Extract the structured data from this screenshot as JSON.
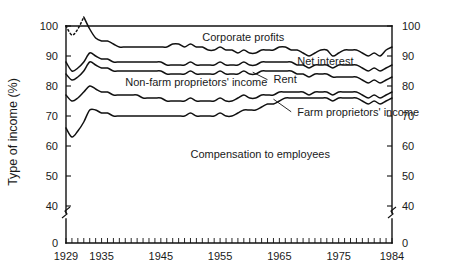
{
  "chart_data": {
    "type": "line",
    "title": "",
    "xlabel": "",
    "ylabel": "Type of income (%)",
    "xlim": [
      1929,
      1984
    ],
    "ylim": [
      35,
      103
    ],
    "grid": false,
    "legend_position": "inline-annotations",
    "axis_break": "y-axis broken between 0 and 40",
    "x_ticks_major": [
      "1929",
      "1935",
      "1945",
      "1955",
      "1965",
      "1975",
      "1984"
    ],
    "y_ticks_left": [
      "100",
      "90",
      "80",
      "70",
      "60",
      "50",
      "40",
      "0"
    ],
    "y_ticks_right": [
      "100",
      "90",
      "80",
      "70",
      "60",
      "50",
      "40",
      "0"
    ],
    "annotations": [
      {
        "text": "Corporate profits",
        "x": 1952,
        "y": 95
      },
      {
        "text": "Net interest",
        "x": 1968,
        "y": 87
      },
      {
        "text": "Rent",
        "x": 1964,
        "y": 81
      },
      {
        "text": "Non-farm proprietors' income",
        "x": 1939,
        "y": 80
      },
      {
        "text": "Farm proprietors' income",
        "x": 1968,
        "y": 70
      },
      {
        "text": "Compensation to employees",
        "x": 1950,
        "y": 56
      }
    ],
    "series": [
      {
        "name": "Corporate profits (upper boundary)",
        "note": "cumulative top boundary; dotted where data interpolated 1930-1932",
        "x": [
          1929,
          1930,
          1931,
          1932,
          1933,
          1934,
          1935,
          1936,
          1937,
          1938,
          1939,
          1940,
          1941,
          1942,
          1943,
          1944,
          1945,
          1946,
          1947,
          1948,
          1949,
          1950,
          1951,
          1952,
          1953,
          1954,
          1955,
          1956,
          1957,
          1958,
          1959,
          1960,
          1961,
          1962,
          1963,
          1964,
          1965,
          1966,
          1967,
          1968,
          1969,
          1970,
          1971,
          1972,
          1973,
          1974,
          1975,
          1976,
          1977,
          1978,
          1979,
          1980,
          1981,
          1982,
          1983,
          1984
        ],
        "y": [
          100,
          97,
          99,
          103,
          99,
          96,
          95,
          95,
          94,
          93,
          93,
          93,
          93,
          93,
          93,
          93,
          93,
          93,
          94,
          94,
          93,
          94,
          93,
          93,
          92,
          92,
          93,
          92,
          92,
          91,
          92,
          91,
          91,
          92,
          92,
          92,
          93,
          93,
          92,
          92,
          91,
          90,
          91,
          92,
          92,
          90,
          91,
          92,
          92,
          92,
          91,
          90,
          91,
          90,
          92,
          93
        ],
        "dotted_segment_x": [
          1929,
          1932
        ]
      },
      {
        "name": "Net interest (boundary below corporate profits)",
        "x": [
          1929,
          1930,
          1931,
          1932,
          1933,
          1934,
          1935,
          1936,
          1937,
          1938,
          1939,
          1940,
          1941,
          1942,
          1943,
          1944,
          1945,
          1946,
          1947,
          1948,
          1949,
          1950,
          1951,
          1952,
          1953,
          1954,
          1955,
          1956,
          1957,
          1958,
          1959,
          1960,
          1961,
          1962,
          1963,
          1964,
          1965,
          1966,
          1967,
          1968,
          1969,
          1970,
          1971,
          1972,
          1973,
          1974,
          1975,
          1976,
          1977,
          1978,
          1979,
          1980,
          1981,
          1982,
          1983,
          1984
        ],
        "y": [
          88,
          85,
          86,
          88,
          91,
          90,
          89,
          89,
          88,
          88,
          88,
          88,
          88,
          88,
          88,
          88,
          88,
          87,
          87,
          87,
          87,
          88,
          87,
          87,
          87,
          87,
          88,
          87,
          87,
          87,
          88,
          87,
          87,
          88,
          88,
          88,
          88,
          88,
          88,
          87,
          87,
          86,
          87,
          87,
          87,
          86,
          87,
          87,
          87,
          87,
          86,
          85,
          86,
          85,
          86,
          87
        ]
      },
      {
        "name": "Rent (boundary below net interest)",
        "x": [
          1929,
          1930,
          1931,
          1932,
          1933,
          1934,
          1935,
          1936,
          1937,
          1938,
          1939,
          1940,
          1941,
          1942,
          1943,
          1944,
          1945,
          1946,
          1947,
          1948,
          1949,
          1950,
          1951,
          1952,
          1953,
          1954,
          1955,
          1956,
          1957,
          1958,
          1959,
          1960,
          1961,
          1962,
          1963,
          1964,
          1965,
          1966,
          1967,
          1968,
          1969,
          1970,
          1971,
          1972,
          1973,
          1974,
          1975,
          1976,
          1977,
          1978,
          1979,
          1980,
          1981,
          1982,
          1983,
          1984
        ],
        "y": [
          84,
          82,
          83,
          85,
          88,
          87,
          86,
          86,
          85,
          85,
          85,
          85,
          85,
          85,
          85,
          85,
          85,
          84,
          84,
          84,
          84,
          85,
          84,
          84,
          84,
          84,
          85,
          84,
          84,
          84,
          85,
          84,
          84,
          85,
          85,
          85,
          85,
          85,
          85,
          84,
          84,
          83,
          84,
          84,
          84,
          83,
          83,
          83,
          83,
          83,
          82,
          81,
          82,
          81,
          82,
          83
        ]
      },
      {
        "name": "Non-farm proprietors' income (boundary)",
        "x": [
          1929,
          1930,
          1931,
          1932,
          1933,
          1934,
          1935,
          1936,
          1937,
          1938,
          1939,
          1940,
          1941,
          1942,
          1943,
          1944,
          1945,
          1946,
          1947,
          1948,
          1949,
          1950,
          1951,
          1952,
          1953,
          1954,
          1955,
          1956,
          1957,
          1958,
          1959,
          1960,
          1961,
          1962,
          1963,
          1964,
          1965,
          1966,
          1967,
          1968,
          1969,
          1970,
          1971,
          1972,
          1973,
          1974,
          1975,
          1976,
          1977,
          1978,
          1979,
          1980,
          1981,
          1982,
          1983,
          1984
        ],
        "y": [
          77,
          75,
          76,
          78,
          80,
          79,
          78,
          78,
          77,
          77,
          77,
          77,
          77,
          76,
          76,
          76,
          76,
          75,
          75,
          75,
          75,
          76,
          75,
          75,
          75,
          75,
          76,
          75,
          75,
          76,
          77,
          76,
          76,
          77,
          77,
          77,
          78,
          78,
          78,
          78,
          78,
          77,
          78,
          78,
          78,
          77,
          78,
          78,
          78,
          78,
          77,
          76,
          77,
          76,
          77,
          78
        ]
      },
      {
        "name": "Farm proprietors' income (boundary / compensation top)",
        "x": [
          1929,
          1930,
          1931,
          1932,
          1933,
          1934,
          1935,
          1936,
          1937,
          1938,
          1939,
          1940,
          1941,
          1942,
          1943,
          1944,
          1945,
          1946,
          1947,
          1948,
          1949,
          1950,
          1951,
          1952,
          1953,
          1954,
          1955,
          1956,
          1957,
          1958,
          1959,
          1960,
          1961,
          1962,
          1963,
          1964,
          1965,
          1966,
          1967,
          1968,
          1969,
          1970,
          1971,
          1972,
          1973,
          1974,
          1975,
          1976,
          1977,
          1978,
          1979,
          1980,
          1981,
          1982,
          1983,
          1984
        ],
        "y": [
          66,
          63,
          65,
          68,
          72,
          72,
          71,
          71,
          70,
          70,
          70,
          70,
          70,
          70,
          70,
          70,
          70,
          70,
          70,
          70,
          70,
          71,
          70,
          70,
          70,
          70,
          71,
          70,
          70,
          71,
          72,
          72,
          72,
          73,
          74,
          74,
          75,
          76,
          76,
          76,
          76,
          76,
          76,
          76,
          76,
          75,
          76,
          76,
          76,
          76,
          75,
          74,
          75,
          74,
          75,
          76
        ]
      }
    ]
  },
  "axis": {
    "ylabel": "Type of income (%)",
    "left_ticks": [
      {
        "label": "100",
        "value": 100
      },
      {
        "label": "90",
        "value": 90
      },
      {
        "label": "80",
        "value": 80
      },
      {
        "label": "70",
        "value": 70
      },
      {
        "label": "60",
        "value": 60
      },
      {
        "label": "50",
        "value": 50
      },
      {
        "label": "40",
        "value": 40
      },
      {
        "label": "0",
        "value": 0
      }
    ],
    "right_ticks": [
      {
        "label": "100",
        "value": 100
      },
      {
        "label": "90",
        "value": 90
      },
      {
        "label": "80",
        "value": 80
      },
      {
        "label": "70",
        "value": 70
      },
      {
        "label": "60",
        "value": 60
      },
      {
        "label": "50",
        "value": 50
      },
      {
        "label": "40",
        "value": 40
      },
      {
        "label": "0",
        "value": 0
      }
    ],
    "x_labels": [
      {
        "label": "1929",
        "value": 1929
      },
      {
        "label": "1935",
        "value": 1935
      },
      {
        "label": "1945",
        "value": 1945
      },
      {
        "label": "1955",
        "value": 1955
      },
      {
        "label": "1965",
        "value": 1965
      },
      {
        "label": "1975",
        "value": 1975
      },
      {
        "label": "1984",
        "value": 1984
      }
    ]
  },
  "labels": {
    "corporate_profits": "Corporate profits",
    "net_interest": "Net interest",
    "rent": "Rent",
    "nonfarm": "Non-farm proprietors' income",
    "farm": "Farm proprietors' income",
    "compensation": "Compensation to employees"
  },
  "colors": {
    "ink": "#111111",
    "background": "#ffffff"
  }
}
